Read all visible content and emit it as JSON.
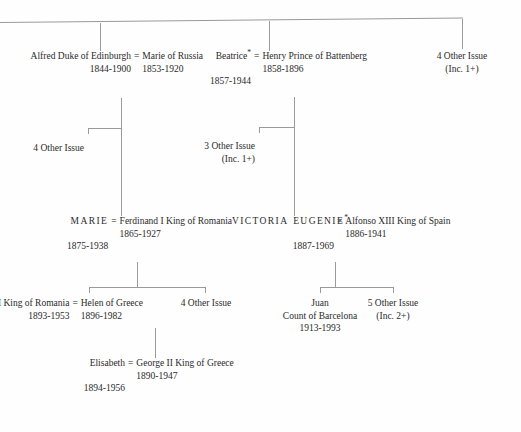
{
  "chart": {
    "type": "genealogy-tree",
    "title": "",
    "symbols": {
      "marriage": "=",
      "descent_note_marker": "*"
    },
    "nodes": {
      "alfred": {
        "name": "Alfred",
        "title": "Duke of Edinburgh",
        "dates": "1844-1900"
      },
      "marie_russia": {
        "name": "Marie",
        "title": "of Russia",
        "dates": "1853-1920"
      },
      "beatrice": {
        "name": "Beatrice",
        "marker": "*",
        "dates": "1857-1944"
      },
      "henry": {
        "name": "Henry",
        "title": "Prince of Battenberg",
        "dates": "1858-1896"
      },
      "top_other_issue": {
        "name": "4 Other Issue",
        "sub": "(Inc. 1+)"
      },
      "alfred_other_issue": {
        "name": "4 Other Issue",
        "sub": ""
      },
      "beatrice_other_issue": {
        "name": "3 Other Issue",
        "sub": "(Inc. 1+)"
      },
      "marie_romania": {
        "name": "MARIE",
        "dates": "1875-1938"
      },
      "ferdinand": {
        "name": "Ferdinand I",
        "title": "King of Romania",
        "dates": "1865-1927"
      },
      "victoria_eugenie": {
        "name_first": "VICTORIA",
        "name_second": "EUGENIE",
        "marker": "*",
        "dates": "1887-1969"
      },
      "alfonso": {
        "name": "Alfonso XIII",
        "title": "King of Spain",
        "dates": "1886-1941"
      },
      "carol": {
        "name": "Carol II",
        "title": "King of Romania",
        "dates": "1893-1953"
      },
      "helen": {
        "name": "Helen",
        "title": "of Greece",
        "dates": "1896-1982"
      },
      "carol_other_issue": {
        "name": "4 Other Issue",
        "sub": ""
      },
      "juan": {
        "name": "Juan",
        "title": "Count of Barcelona",
        "dates": "1913-1993"
      },
      "juan_other_issue": {
        "name": "5 Other Issue",
        "sub": "(Inc. 2+)"
      },
      "elisabeth": {
        "name": "Elisabeth",
        "dates": "1894-1956"
      },
      "george": {
        "name": "George II",
        "title": "King of Greece",
        "dates": "1890-1947"
      }
    }
  }
}
